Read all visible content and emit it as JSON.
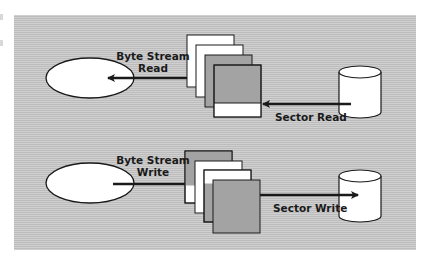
{
  "diagram": {
    "colors": {
      "panel": "#c6c6c6",
      "card_gray": "#a3a3a3",
      "card_white": "#ffffff",
      "stroke": "#1a1a1a"
    },
    "read_path": {
      "byte_stream_label_line1": "Byte Stream",
      "byte_stream_label_line2": "Read",
      "sector_label": "Sector Read",
      "source": "ellipse",
      "buffer": "stack-of-4-blocks",
      "device": "disk-cylinder",
      "arrow_direction": "disk-to-blocks-to-ellipse"
    },
    "write_path": {
      "byte_stream_label_line1": "Byte Stream",
      "byte_stream_label_line2": "Write",
      "sector_label": "Sector Write",
      "source": "ellipse",
      "buffer": "stack-of-4-blocks",
      "device": "disk-cylinder",
      "arrow_direction": "ellipse-to-blocks-to-disk"
    }
  }
}
